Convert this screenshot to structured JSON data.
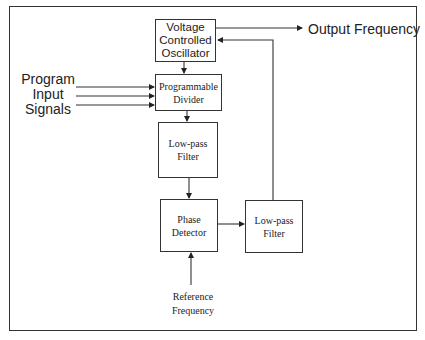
{
  "diagram": {
    "type": "block-diagram",
    "blocks": {
      "vco": {
        "lines": [
          "Voltage",
          "Controlled",
          "Oscillator"
        ]
      },
      "divider": {
        "lines": [
          "Programmable",
          "Divider"
        ]
      },
      "lpf_left": {
        "lines": [
          "Low-pass",
          "Filter"
        ]
      },
      "phase_detector": {
        "lines": [
          "Phase",
          "Detector"
        ]
      },
      "lpf_right": {
        "lines": [
          "Low-pass",
          "Filter"
        ]
      }
    },
    "labels": {
      "program_inputs": [
        "Program",
        "Input",
        "Signals"
      ],
      "output": "Output Frequency",
      "reference": [
        "Reference",
        "Frequency"
      ]
    },
    "connections": [
      {
        "from": "vco",
        "to": "output"
      },
      {
        "from": "vco",
        "to": "divider"
      },
      {
        "from": "program_inputs",
        "to": "divider",
        "count": 3
      },
      {
        "from": "divider",
        "to": "lpf_left"
      },
      {
        "from": "lpf_left",
        "to": "phase_detector"
      },
      {
        "from": "reference",
        "to": "phase_detector"
      },
      {
        "from": "phase_detector",
        "to": "lpf_right"
      },
      {
        "from": "lpf_right",
        "to": "vco"
      }
    ],
    "colors": {
      "line": "#333333",
      "text": "#222222",
      "background": "#ffffff"
    }
  }
}
